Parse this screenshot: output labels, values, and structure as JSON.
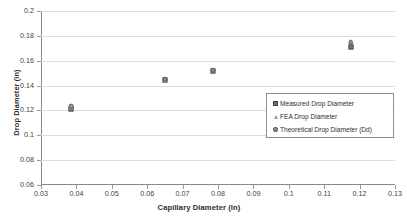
{
  "chart_data": {
    "type": "scatter",
    "title": "",
    "xlabel": "Capillary Diameter (in)",
    "ylabel": "Drop Diameter (in)",
    "xlim": [
      0.03,
      0.13
    ],
    "ylim": [
      0.06,
      0.2
    ],
    "xticks": [
      "0.03",
      "0.04",
      "0.05",
      "0.06",
      "0.07",
      "0.08",
      "0.09",
      "0.1",
      "0.11",
      "0.12",
      "0.13"
    ],
    "xtick_values": [
      0.03,
      0.04,
      0.05,
      0.06,
      0.07,
      0.08,
      0.09,
      0.1,
      0.11,
      0.12,
      0.13
    ],
    "yticks": [
      "0.06",
      "0.08",
      "0.1",
      "0.12",
      "0.14",
      "0.16",
      "0.18",
      "0.2"
    ],
    "ytick_values": [
      0.06,
      0.08,
      0.1,
      0.12,
      0.14,
      0.16,
      0.18,
      0.2
    ],
    "grid": "horizontal",
    "legend_position": "center-right",
    "x": [
      0.0385,
      0.065,
      0.0785,
      0.1175
    ],
    "series": [
      {
        "name": "Measured Drop Diameter",
        "marker": "square",
        "color": "#7a7a7a",
        "values": [
          0.1215,
          0.1443,
          0.1518,
          0.171
        ]
      },
      {
        "name": "FEA Drop Diameter",
        "marker": "triangle",
        "color": "#8d8d8d",
        "values": [
          0.1228,
          0.1448,
          0.1528,
          0.1752
        ]
      },
      {
        "name": "Theoretical Drop Diameter (Dd)",
        "marker": "circle",
        "color": "#9a9a9a",
        "values": [
          0.1232,
          0.145,
          0.1524,
          0.1748
        ]
      }
    ]
  },
  "legend": {
    "entries": [
      {
        "label": "Measured Drop Diameter",
        "marker": "square"
      },
      {
        "label": "FEA Drop Diameter",
        "marker": "triangle"
      },
      {
        "label": "Theoretical Drop Diameter (Dd)",
        "marker": "circle"
      }
    ]
  },
  "axes": {
    "x_title": "Capillary Diameter (in)",
    "y_title": "Drop Diameter (in)"
  }
}
